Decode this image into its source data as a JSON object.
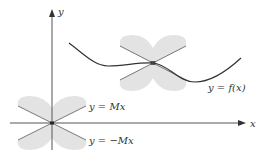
{
  "diagram": {
    "axes": {
      "x_label": "x",
      "y_label": "y"
    },
    "labels": {
      "upper_line": "y = Mx",
      "lower_line": "y = −Mx",
      "curve": "y = f(x)"
    },
    "colors": {
      "axis": "#555555",
      "curve": "#333333",
      "cone_lines": "#777777",
      "shade": "#e3e3e3",
      "text": "#333333"
    }
  }
}
